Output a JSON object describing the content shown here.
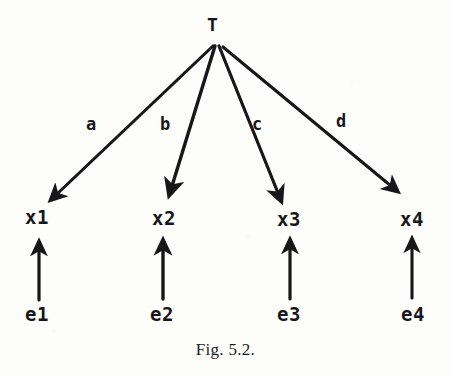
{
  "figure": {
    "caption": "Fig. 5.2.",
    "background_color": "#fdfdfb",
    "ink_color": "#17171a",
    "width": 451,
    "height": 376
  },
  "diagram": {
    "type": "path-diagram",
    "root": {
      "label": "T",
      "x": 214,
      "y": 24
    },
    "observed_nodes": [
      {
        "label": "x1",
        "x": 39,
        "y": 217
      },
      {
        "label": "x2",
        "x": 166,
        "y": 218
      },
      {
        "label": "x3",
        "x": 290,
        "y": 219
      },
      {
        "label": "x4",
        "x": 413,
        "y": 219
      }
    ],
    "error_nodes": [
      {
        "label": "e1",
        "x": 39,
        "y": 314
      },
      {
        "label": "e2",
        "x": 164,
        "y": 314
      },
      {
        "label": "e3",
        "x": 290,
        "y": 314
      },
      {
        "label": "e4",
        "x": 414,
        "y": 314
      }
    ],
    "loading_edges": [
      {
        "label": "a",
        "from": "T",
        "to": "x1",
        "label_x": 92,
        "label_y": 125
      },
      {
        "label": "b",
        "from": "T",
        "to": "x2",
        "label_x": 166,
        "label_y": 125
      },
      {
        "label": "c",
        "from": "T",
        "to": "x3",
        "label_x": 258,
        "label_y": 125
      },
      {
        "label": "d",
        "from": "T",
        "to": "x4",
        "label_x": 342,
        "label_y": 122
      }
    ],
    "error_edges": [
      {
        "from": "e1",
        "to": "x1"
      },
      {
        "from": "e2",
        "to": "x2"
      },
      {
        "from": "e3",
        "to": "x3"
      },
      {
        "from": "e4",
        "to": "x4"
      }
    ]
  }
}
